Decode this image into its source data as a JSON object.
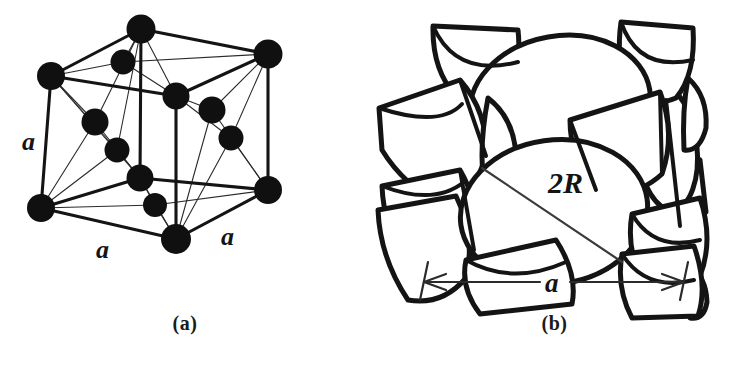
{
  "figure": {
    "background_color": "#ffffff",
    "line_color": "#141414",
    "atom_fill_color": "#101010"
  },
  "panels": [
    {
      "id": "a",
      "caption": "(a)",
      "kind": "ball-and-stick-unit-cell",
      "description": "Reduced-sphere ball and stick model of the FCC unit cell",
      "edge_labels": [
        {
          "text": "a",
          "position": "left-vertical-edge"
        },
        {
          "text": "a",
          "position": "bottom-left-edge"
        },
        {
          "text": "a",
          "position": "bottom-right-edge"
        }
      ],
      "atom_count": 14,
      "corner_atoms": 8,
      "face_atoms": 6
    },
    {
      "id": "b",
      "caption": "(b)",
      "kind": "hard-sphere-packing",
      "description": "Hard sphere (atomic packing) model of the FCC unit cell",
      "diagonal_label": "2R",
      "dimension_label": "a"
    }
  ],
  "captions": {
    "a": "(a)",
    "b": "(b)"
  },
  "labels": {
    "lattice_parameter": "a",
    "sphere_diameter": "2R"
  }
}
